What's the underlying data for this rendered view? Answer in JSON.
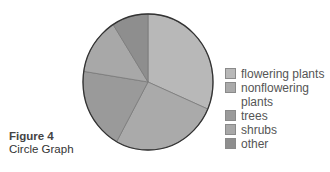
{
  "caption": {
    "title": "Figure 4",
    "subtitle": "Circle Graph"
  },
  "legend": [
    {
      "label": "flowering plants",
      "color": "#b8b8b8"
    },
    {
      "label": "nonflowering plants",
      "color": "#aaaaaa"
    },
    {
      "label": "trees",
      "color": "#9a9a9a"
    },
    {
      "label": "shrubs",
      "color": "#a8a8a8"
    },
    {
      "label": "other",
      "color": "#8e8e8e"
    }
  ],
  "chart_data": {
    "type": "pie",
    "title": "Figure 4",
    "subtitle": "Circle Graph",
    "categories": [
      "flowering plants",
      "nonflowering plants",
      "trees",
      "shrubs",
      "other"
    ],
    "values": [
      31.5,
      26.5,
      19.5,
      13.5,
      9
    ],
    "unit": "percent (estimated from slice angles)",
    "colors": [
      "#b8b8b8",
      "#aaaaaa",
      "#9a9a9a",
      "#a8a8a8",
      "#8e8e8e"
    ],
    "start_angle": "12 o'clock",
    "direction": "clockwise",
    "legend_position": "right"
  }
}
